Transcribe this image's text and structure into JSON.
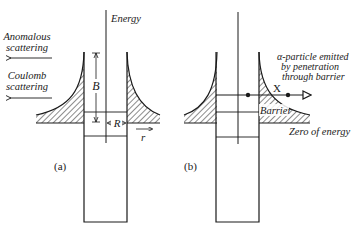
{
  "figure": {
    "panel_a": {
      "label": "(a)",
      "axis_label": "Energy",
      "left_arrow_labels": [
        {
          "line1": "Anomalous",
          "line2": "scattering"
        },
        {
          "line1": "Coulomb",
          "line2": "scattering"
        }
      ],
      "barrier_height_label": "B",
      "radius_label": "R",
      "r_axis_label": "r"
    },
    "panel_b": {
      "label": "(b)",
      "emission_note": {
        "line1": "α-particle emitted",
        "line2": "by penetration",
        "line3": "through barrier"
      },
      "tunnel_label": "X",
      "barrier_label": "Barrier",
      "zero_energy_label": "Zero of energy"
    },
    "colors": {
      "ink": "#1a1a1a",
      "background": "#ffffff"
    }
  }
}
